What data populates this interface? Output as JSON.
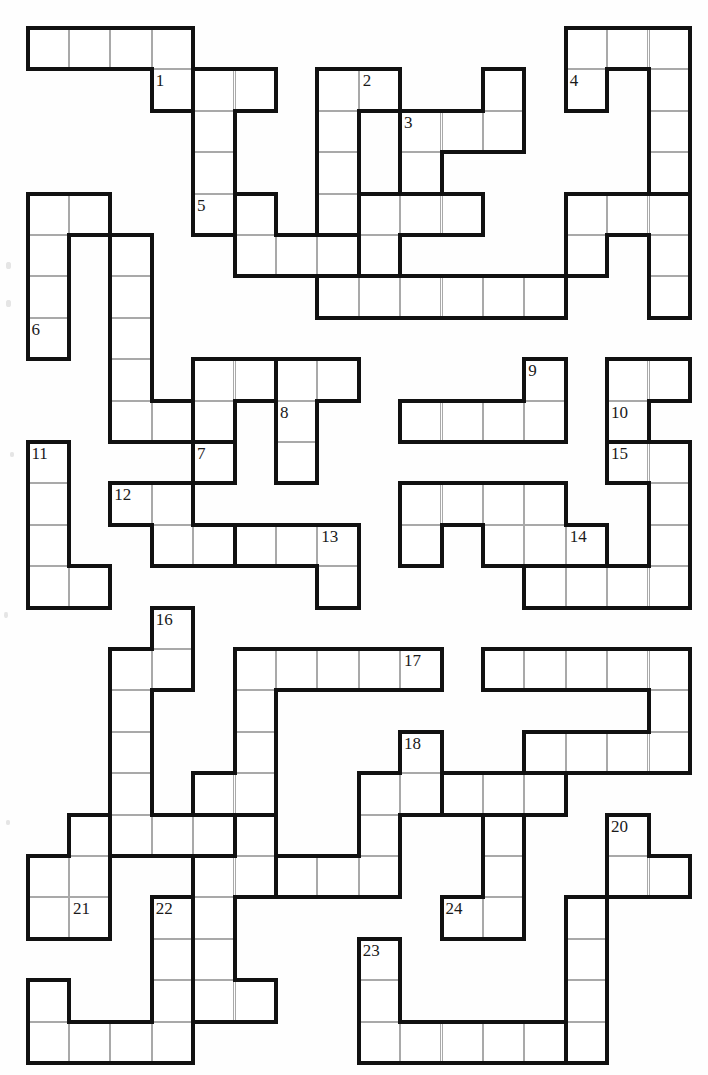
{
  "puzzle": {
    "type": "polyomino-fill-in-puzzle",
    "grid": {
      "origin_x": 27.5,
      "origin_y": 28.0,
      "cell": 41.4,
      "cols": 16,
      "rows": 25,
      "line_thin": "#a9a9a9",
      "line_thick": "#111111",
      "thick_width": 4,
      "cell_fill": "#ffffff",
      "page_bg": "#fefefe"
    },
    "clue_numbers": [
      "1",
      "2",
      "3",
      "4",
      "5",
      "6",
      "7",
      "8",
      "9",
      "10",
      "11",
      "12",
      "13",
      "14",
      "15",
      "16",
      "17",
      "18",
      "19",
      "20",
      "21",
      "22",
      "23",
      "24"
    ],
    "pieces": [
      {
        "id": 1,
        "label": "1",
        "label_cell": [
          3,
          1
        ],
        "cells": [
          [
            0,
            0
          ],
          [
            1,
            0
          ],
          [
            2,
            0
          ],
          [
            3,
            0
          ],
          [
            3,
            1
          ]
        ]
      },
      {
        "id": 2,
        "label": "2",
        "label_cell": [
          8,
          1
        ],
        "cells": [
          [
            7,
            1
          ],
          [
            8,
            1
          ],
          [
            7,
            2
          ],
          [
            7,
            3
          ],
          [
            7,
            4
          ]
        ]
      },
      {
        "id": 3,
        "label": "3",
        "label_cell": [
          9,
          2
        ],
        "cells": [
          [
            11,
            1
          ],
          [
            9,
            2
          ],
          [
            10,
            2
          ],
          [
            11,
            2
          ],
          [
            9,
            3
          ]
        ]
      },
      {
        "id": 4,
        "label": "4",
        "label_cell": [
          13,
          1
        ],
        "cells": [
          [
            13,
            0
          ],
          [
            14,
            0
          ],
          [
            15,
            0
          ],
          [
            13,
            1
          ],
          [
            15,
            1
          ],
          [
            15,
            2
          ],
          [
            15,
            3
          ]
        ]
      },
      {
        "id": 5,
        "label": "5",
        "label_cell": [
          4,
          4
        ],
        "cells": [
          [
            4,
            1
          ],
          [
            5,
            1
          ],
          [
            4,
            2
          ],
          [
            4,
            3
          ],
          [
            4,
            4
          ]
        ]
      },
      {
        "id": 6,
        "label": "6",
        "label_cell": [
          0,
          7
        ],
        "cells": [
          [
            0,
            4
          ],
          [
            1,
            4
          ],
          [
            0,
            5
          ],
          [
            0,
            6
          ],
          [
            0,
            7
          ]
        ]
      },
      {
        "id": 7,
        "label": "7",
        "label_cell": [
          4,
          10
        ],
        "cells": [
          [
            2,
            5
          ],
          [
            2,
            6
          ],
          [
            2,
            7
          ],
          [
            2,
            8
          ],
          [
            2,
            9
          ],
          [
            3,
            9
          ],
          [
            4,
            9
          ],
          [
            4,
            10
          ]
        ]
      },
      {
        "id": 8,
        "label": "8",
        "label_cell": [
          6,
          9
        ],
        "cells": [
          [
            6,
            8
          ],
          [
            7,
            8
          ],
          [
            6,
            9
          ],
          [
            6,
            10
          ]
        ]
      },
      {
        "id": 9,
        "label": "9",
        "label_cell": [
          12,
          8
        ],
        "cells": [
          [
            12,
            8
          ],
          [
            9,
            9
          ],
          [
            10,
            9
          ],
          [
            11,
            9
          ],
          [
            12,
            9
          ]
        ]
      },
      {
        "id": 10,
        "label": "10",
        "label_cell": [
          14,
          9
        ],
        "cells": [
          [
            14,
            8
          ],
          [
            15,
            8
          ],
          [
            14,
            9
          ]
        ]
      },
      {
        "id": 11,
        "label": "11",
        "label_cell": [
          0,
          10
        ],
        "cells": [
          [
            0,
            10
          ],
          [
            0,
            11
          ],
          [
            0,
            12
          ],
          [
            0,
            13
          ],
          [
            1,
            13
          ]
        ]
      },
      {
        "id": 12,
        "label": "12",
        "label_cell": [
          2,
          11
        ],
        "cells": [
          [
            2,
            11
          ],
          [
            3,
            11
          ],
          [
            3,
            12
          ],
          [
            4,
            12
          ]
        ]
      },
      {
        "id": 13,
        "label": "13",
        "label_cell": [
          7,
          12
        ],
        "cells": [
          [
            5,
            12
          ],
          [
            6,
            12
          ],
          [
            7,
            12
          ],
          [
            7,
            13
          ]
        ]
      },
      {
        "id": 14,
        "label": "14",
        "label_cell": [
          13,
          12
        ],
        "cells": [
          [
            9,
            11
          ],
          [
            10,
            11
          ],
          [
            11,
            11
          ],
          [
            12,
            11
          ],
          [
            9,
            12
          ],
          [
            11,
            12
          ],
          [
            12,
            12
          ],
          [
            13,
            12
          ]
        ]
      },
      {
        "id": 15,
        "label": "15",
        "label_cell": [
          14,
          10
        ],
        "cells": [
          [
            14,
            10
          ],
          [
            15,
            10
          ],
          [
            15,
            11
          ],
          [
            15,
            12
          ],
          [
            12,
            13
          ],
          [
            13,
            13
          ],
          [
            14,
            13
          ],
          [
            15,
            13
          ]
        ]
      },
      {
        "id": 16,
        "label": "16",
        "label_cell": [
          3,
          14
        ],
        "cells": [
          [
            3,
            14
          ],
          [
            2,
            15
          ],
          [
            3,
            15
          ],
          [
            2,
            16
          ],
          [
            2,
            17
          ],
          [
            2,
            18
          ],
          [
            2,
            19
          ],
          [
            3,
            19
          ],
          [
            4,
            19
          ]
        ]
      },
      {
        "id": 17,
        "label": "17",
        "label_cell": [
          9,
          15
        ],
        "cells": [
          [
            5,
            15
          ],
          [
            6,
            15
          ],
          [
            7,
            15
          ],
          [
            8,
            15
          ],
          [
            9,
            15
          ],
          [
            5,
            16
          ],
          [
            5,
            17
          ],
          [
            4,
            18
          ],
          [
            5,
            18
          ]
        ]
      },
      {
        "id": 18,
        "label": "18",
        "label_cell": [
          9,
          17
        ],
        "cells": [
          [
            9,
            17
          ],
          [
            8,
            18
          ],
          [
            9,
            18
          ],
          [
            8,
            19
          ],
          [
            6,
            20
          ],
          [
            7,
            20
          ],
          [
            8,
            20
          ]
        ]
      },
      {
        "id": 19,
        "label": "19",
        "label_cell": [
          12,
          18
        ],
        "cells": [
          [
            11,
            15
          ],
          [
            12,
            15
          ],
          [
            13,
            15
          ],
          [
            14,
            15
          ],
          [
            15,
            15
          ],
          [
            15,
            16
          ],
          [
            12,
            17
          ],
          [
            13,
            17
          ],
          [
            14,
            17
          ],
          [
            15,
            17
          ],
          [
            12,
            18
          ]
        ]
      },
      {
        "id": 20,
        "label": "20",
        "label_cell": [
          14,
          19
        ],
        "cells": [
          [
            14,
            19
          ],
          [
            14,
            20
          ],
          [
            15,
            20
          ]
        ]
      },
      {
        "id": 21,
        "label": "21",
        "label_cell": [
          1,
          21
        ],
        "cells": [
          [
            1,
            19
          ],
          [
            0,
            20
          ],
          [
            1,
            20
          ],
          [
            0,
            21
          ],
          [
            1,
            21
          ]
        ]
      },
      {
        "id": 22,
        "label": "22",
        "label_cell": [
          3,
          21
        ],
        "cells": [
          [
            3,
            21
          ],
          [
            3,
            22
          ],
          [
            3,
            23
          ],
          [
            0,
            23
          ],
          [
            0,
            24
          ],
          [
            1,
            24
          ],
          [
            2,
            24
          ],
          [
            3,
            24
          ]
        ]
      },
      {
        "id": 23,
        "label": "23",
        "label_cell": [
          8,
          22
        ],
        "cells": [
          [
            8,
            22
          ],
          [
            8,
            23
          ],
          [
            8,
            24
          ],
          [
            9,
            24
          ],
          [
            10,
            24
          ],
          [
            11,
            24
          ],
          [
            12,
            24
          ]
        ]
      },
      {
        "id": 24,
        "label": "24",
        "label_cell": [
          10,
          21
        ],
        "cells": [
          [
            11,
            19
          ],
          [
            11,
            20
          ],
          [
            10,
            21
          ],
          [
            11,
            21
          ]
        ]
      },
      {
        "id": 25,
        "label": "",
        "label_cell": null,
        "cells": [
          [
            5,
            19
          ],
          [
            4,
            20
          ],
          [
            5,
            20
          ],
          [
            4,
            21
          ],
          [
            4,
            22
          ],
          [
            4,
            23
          ],
          [
            5,
            23
          ]
        ]
      },
      {
        "id": 26,
        "label": "",
        "label_cell": null,
        "cells": [
          [
            8,
            4
          ],
          [
            9,
            4
          ],
          [
            10,
            4
          ],
          [
            8,
            5
          ],
          [
            8,
            6
          ]
        ]
      },
      {
        "id": 27,
        "label": "",
        "label_cell": null,
        "cells": [
          [
            13,
            4
          ],
          [
            14,
            4
          ],
          [
            15,
            4
          ],
          [
            13,
            5
          ],
          [
            15,
            5
          ],
          [
            15,
            6
          ]
        ]
      },
      {
        "id": 28,
        "label": "",
        "label_cell": null,
        "cells": [
          [
            5,
            4
          ],
          [
            5,
            5
          ],
          [
            6,
            5
          ],
          [
            7,
            5
          ],
          [
            7,
            6
          ]
        ]
      },
      {
        "id": 29,
        "label": "",
        "label_cell": null,
        "cells": [
          [
            7,
            6
          ],
          [
            8,
            6
          ],
          [
            9,
            6
          ],
          [
            10,
            6
          ],
          [
            11,
            6
          ],
          [
            12,
            6
          ]
        ]
      },
      {
        "id": 30,
        "label": "",
        "label_cell": null,
        "cells": [
          [
            4,
            8
          ],
          [
            5,
            8
          ],
          [
            4,
            9
          ]
        ]
      },
      {
        "id": 31,
        "label": "",
        "label_cell": null,
        "cells": [
          [
            13,
            21
          ],
          [
            13,
            22
          ],
          [
            13,
            23
          ],
          [
            13,
            24
          ]
        ]
      },
      {
        "id": 32,
        "label": "",
        "label_cell": null,
        "cells": [
          [
            10,
            18
          ],
          [
            11,
            18
          ],
          [
            12,
            18
          ]
        ]
      }
    ]
  }
}
